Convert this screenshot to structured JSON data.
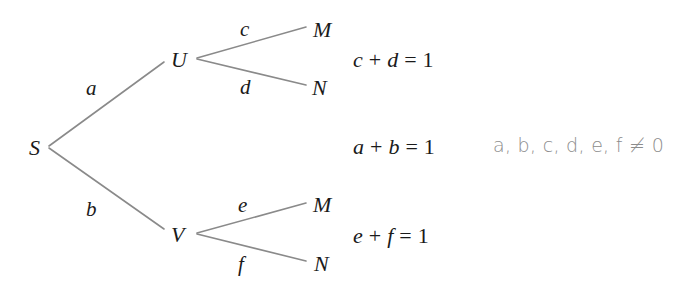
{
  "diagram": {
    "type": "probability-tree",
    "colors": {
      "edge_line": "#8a8a8a",
      "text": "#1a1a1a",
      "note_text": "#8c8c8c"
    },
    "nodes": {
      "root": "S",
      "upper": "U",
      "lower": "V",
      "upper_top_leaf": "M",
      "upper_bottom_leaf": "N",
      "lower_top_leaf": "M",
      "lower_bottom_leaf": "N"
    },
    "edges": {
      "S_U": "a",
      "S_V": "b",
      "U_M": "c",
      "U_N": "d",
      "V_M": "e",
      "V_N": "f"
    },
    "equations": [
      {
        "left": "c",
        "op1": "+",
        "right": "d",
        "op2": "=",
        "value": "1"
      },
      {
        "left": "a",
        "op1": "+",
        "right": "b",
        "op2": "=",
        "value": "1"
      },
      {
        "left": "e",
        "op1": "+",
        "right": "f",
        "op2": "=",
        "value": "1"
      }
    ],
    "constraint_note": "a, b, c, d, e, f ≠ 0"
  }
}
